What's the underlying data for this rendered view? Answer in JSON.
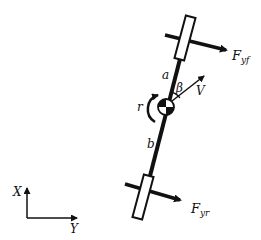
{
  "diagram": {
    "labels": {
      "front_force": "F",
      "front_force_sub": "yf",
      "rear_force": "F",
      "rear_force_sub": "yr",
      "dist_front": "a",
      "dist_rear": "b",
      "slip_angle": "β",
      "velocity": "V",
      "yaw_rate": "r",
      "axis_x": "X",
      "axis_y": "Y"
    },
    "colors": {
      "ink": "#111111",
      "background": "#ffffff"
    }
  }
}
